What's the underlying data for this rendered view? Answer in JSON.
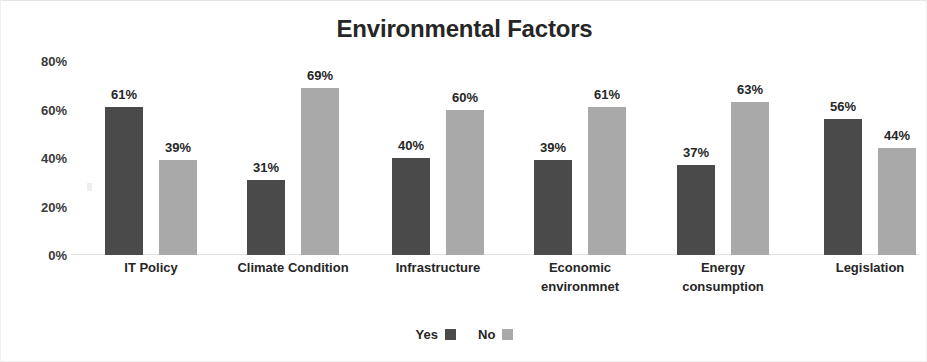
{
  "chart_data": {
    "type": "bar",
    "title": "Environmental Factors",
    "xlabel": "",
    "ylabel": "",
    "ylim": [
      0,
      80
    ],
    "yticks": [
      0,
      20,
      40,
      60,
      80
    ],
    "ytick_labels": [
      "0%",
      "20%",
      "40%",
      "60%",
      "80%"
    ],
    "grid": false,
    "legend_position": "bottom",
    "value_suffix": "%",
    "categories": [
      "IT Policy",
      "Climate Condition",
      "Infrastructure",
      "Economic\nenvironmnet",
      "Energy\nconsumption",
      "Legislation"
    ],
    "series": [
      {
        "name": "Yes",
        "color": "#4a4a4a",
        "values": [
          61,
          31,
          40,
          39,
          37,
          56
        ],
        "labels": [
          "61%",
          "31%",
          "40%",
          "39%",
          "37%",
          "56%"
        ]
      },
      {
        "name": "No",
        "color": "#a9a9a9",
        "values": [
          39,
          69,
          60,
          61,
          63,
          44
        ],
        "labels": [
          "39%",
          "69%",
          "60%",
          "61%",
          "63%",
          "44%"
        ]
      }
    ]
  },
  "legend": {
    "items": [
      {
        "label": "Yes",
        "color": "#4a4a4a"
      },
      {
        "label": "No",
        "color": "#a9a9a9"
      }
    ]
  }
}
